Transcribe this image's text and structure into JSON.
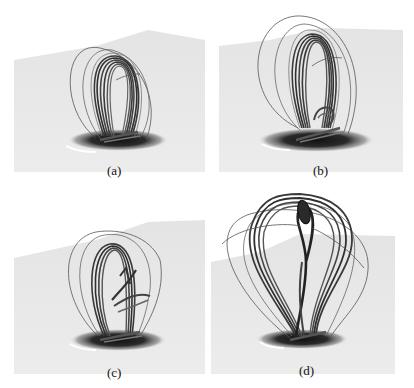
{
  "figure": {
    "panels": [
      {
        "id": "a",
        "caption": "(a)",
        "description": "Twisted magnetic flux rope loops rising above a dark photospheric spot, early stage"
      },
      {
        "id": "b",
        "caption": "(b)",
        "description": "Flux rope loops expanded, with additional low-lying twisted structure near the footpoints"
      },
      {
        "id": "c",
        "caption": "(c)",
        "description": "Flux rope with crossing / reconnecting strands at mid-height"
      },
      {
        "id": "d",
        "caption": "(d)",
        "description": "Erupting flux rope with elongated helical core rising high above the surface"
      }
    ],
    "colors": {
      "plane": "#e9e9e9",
      "plane_edge": "#f3f3f3",
      "spot": "#1c1c1c",
      "field_line": "#3a3a3a",
      "field_line_light": "#8a8a8a",
      "outer_loop": "#555555"
    }
  }
}
